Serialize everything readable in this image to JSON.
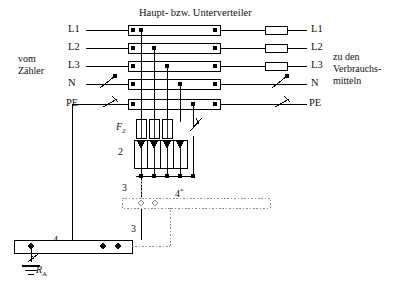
{
  "diagram": {
    "title_text": "Haupt- bzw. Unterverteiler",
    "left_caption_line1": "vom",
    "left_caption_line2": "Zähler",
    "right_caption_line1": "zu den",
    "right_caption_line2": "Verbrauchs-",
    "right_caption_line3": "mitteln",
    "rails_in": [
      "L1",
      "L2",
      "L3",
      "N",
      "PE"
    ],
    "rails_out": [
      "L1",
      "L2",
      "L3",
      "N",
      "PE"
    ],
    "arrester_group_label": "F",
    "arrester_group_sub": "2",
    "arrester_block_label": "2",
    "bonding_conductor_label_upper": "3",
    "bonding_conductor_label_lower": "3",
    "bonding_bar_label": "4",
    "bonding_bar_dotted_label": "4",
    "bonding_bar_dotted_sup": "*",
    "earth_resistance_label": "R",
    "earth_resistance_sub": "A",
    "colors": {
      "line": "#000000",
      "dotted": "#9a9a9a",
      "background": "#ffffff"
    }
  }
}
